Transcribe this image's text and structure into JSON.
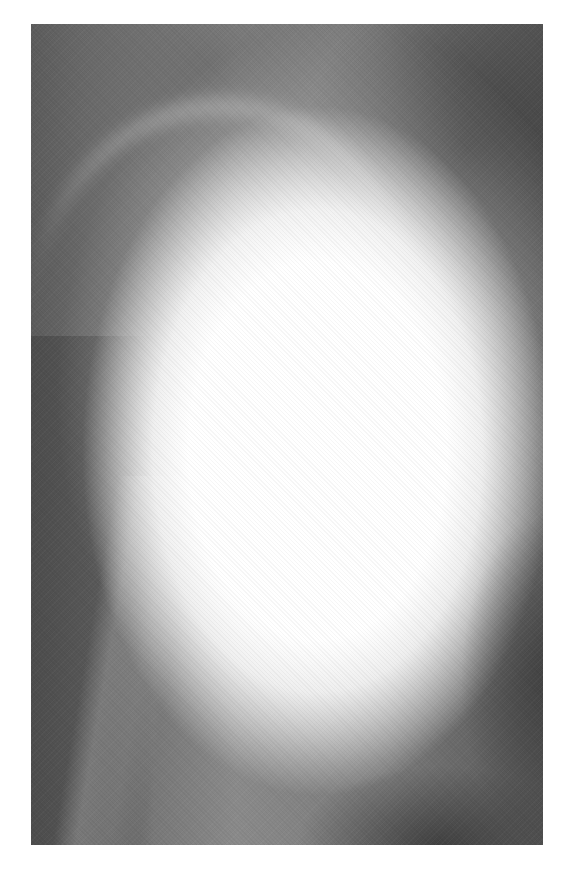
{
  "image": {
    "type": "grayscale radiograph",
    "description": "X-ray showing a large bright radiopaque oval mass with surrounding bone structures",
    "colors": {
      "background_page": "#ffffff",
      "dark_tissue": "#5c5c5c",
      "bright_region": "#ffffff"
    }
  }
}
